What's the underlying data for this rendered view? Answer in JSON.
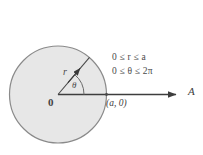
{
  "figure": {
    "kind": "polar-region-diagram",
    "background_color": "#ffffff",
    "disk": {
      "fill_color": "#e7e7e7",
      "stroke_color": "#8a8a8a",
      "center_x": 58,
      "center_y": 94.5,
      "radius": 48.5
    },
    "axis": {
      "stroke_color": "#3d3d3d",
      "start_x": 58,
      "start_y": 94.5,
      "end_x": 182,
      "end_y": 94.5,
      "label": "A"
    },
    "radius_vector": {
      "stroke_color": "#4a4a4a",
      "angle_degrees": 50,
      "label": "r"
    },
    "angle_arc": {
      "stroke_color": "#6a6a6a",
      "label": "θ",
      "arc_radius": 26
    },
    "labels": {
      "origin": "0",
      "radius": "r",
      "angle": "θ",
      "boundary_point": "(a, 0)",
      "axis_ray": "A"
    },
    "constraints": [
      "0 ≤ r ≤ a",
      "0 ≤ θ ≤ 2π"
    ]
  }
}
